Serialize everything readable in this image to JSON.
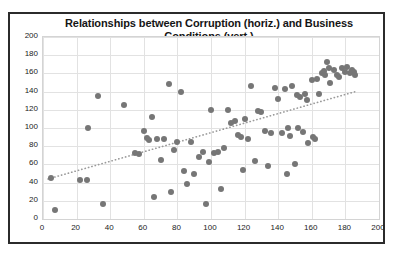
{
  "chart_data": {
    "type": "scatter",
    "title": "Relationships between Corruption (horiz.) and Business Conditions (vert.)",
    "title_line1": "Relationships between Corruption (horiz.) and Business",
    "title_line2": "Conditions (vert.)",
    "xlabel": "Corruption",
    "ylabel": "Business Conditions",
    "xlim": [
      0,
      200
    ],
    "ylim": [
      0,
      200
    ],
    "xticks": [
      0,
      20,
      40,
      60,
      80,
      100,
      120,
      140,
      160,
      180,
      200
    ],
    "yticks": [
      0,
      20,
      40,
      60,
      80,
      100,
      120,
      140,
      160,
      180,
      200
    ],
    "grid": true,
    "legend": "none",
    "marker_color": "#767676",
    "marker_size": 6,
    "trendline": {
      "type": "linear",
      "style": "dotted",
      "color": "#9a9a9a",
      "x_start": 3,
      "y_start": 44,
      "x_end": 186,
      "y_end": 140
    },
    "points": [
      {
        "x": 7,
        "y": 10
      },
      {
        "x": 5,
        "y": 45
      },
      {
        "x": 22,
        "y": 43
      },
      {
        "x": 26,
        "y": 43
      },
      {
        "x": 27,
        "y": 100
      },
      {
        "x": 33,
        "y": 135
      },
      {
        "x": 36,
        "y": 17
      },
      {
        "x": 48,
        "y": 125
      },
      {
        "x": 55,
        "y": 73
      },
      {
        "x": 57,
        "y": 71
      },
      {
        "x": 60,
        "y": 97
      },
      {
        "x": 62,
        "y": 89
      },
      {
        "x": 63,
        "y": 87
      },
      {
        "x": 65,
        "y": 112
      },
      {
        "x": 66,
        "y": 24
      },
      {
        "x": 68,
        "y": 88
      },
      {
        "x": 70,
        "y": 65
      },
      {
        "x": 72,
        "y": 88
      },
      {
        "x": 75,
        "y": 148
      },
      {
        "x": 76,
        "y": 30
      },
      {
        "x": 78,
        "y": 76
      },
      {
        "x": 80,
        "y": 85
      },
      {
        "x": 82,
        "y": 140
      },
      {
        "x": 84,
        "y": 53
      },
      {
        "x": 86,
        "y": 38
      },
      {
        "x": 88,
        "y": 85
      },
      {
        "x": 90,
        "y": 50
      },
      {
        "x": 93,
        "y": 68
      },
      {
        "x": 95,
        "y": 74
      },
      {
        "x": 97,
        "y": 17
      },
      {
        "x": 99,
        "y": 63
      },
      {
        "x": 100,
        "y": 120
      },
      {
        "x": 102,
        "y": 73
      },
      {
        "x": 104,
        "y": 74
      },
      {
        "x": 106,
        "y": 33
      },
      {
        "x": 108,
        "y": 78
      },
      {
        "x": 110,
        "y": 120
      },
      {
        "x": 112,
        "y": 105
      },
      {
        "x": 114,
        "y": 108
      },
      {
        "x": 116,
        "y": 92
      },
      {
        "x": 118,
        "y": 90
      },
      {
        "x": 119,
        "y": 54
      },
      {
        "x": 120,
        "y": 110
      },
      {
        "x": 122,
        "y": 88
      },
      {
        "x": 124,
        "y": 146
      },
      {
        "x": 126,
        "y": 64
      },
      {
        "x": 128,
        "y": 119
      },
      {
        "x": 130,
        "y": 118
      },
      {
        "x": 132,
        "y": 97
      },
      {
        "x": 134,
        "y": 58
      },
      {
        "x": 136,
        "y": 95
      },
      {
        "x": 138,
        "y": 144
      },
      {
        "x": 140,
        "y": 132
      },
      {
        "x": 142,
        "y": 95
      },
      {
        "x": 144,
        "y": 143
      },
      {
        "x": 145,
        "y": 50
      },
      {
        "x": 146,
        "y": 100
      },
      {
        "x": 147,
        "y": 91
      },
      {
        "x": 148,
        "y": 146
      },
      {
        "x": 150,
        "y": 60
      },
      {
        "x": 151,
        "y": 136
      },
      {
        "x": 152,
        "y": 100
      },
      {
        "x": 153,
        "y": 134
      },
      {
        "x": 155,
        "y": 96
      },
      {
        "x": 156,
        "y": 137
      },
      {
        "x": 157,
        "y": 131
      },
      {
        "x": 158,
        "y": 83
      },
      {
        "x": 160,
        "y": 153
      },
      {
        "x": 161,
        "y": 90
      },
      {
        "x": 162,
        "y": 88
      },
      {
        "x": 163,
        "y": 154
      },
      {
        "x": 164,
        "y": 137
      },
      {
        "x": 166,
        "y": 160
      },
      {
        "x": 167,
        "y": 163
      },
      {
        "x": 168,
        "y": 158
      },
      {
        "x": 169,
        "y": 172
      },
      {
        "x": 170,
        "y": 166
      },
      {
        "x": 171,
        "y": 150
      },
      {
        "x": 173,
        "y": 164
      },
      {
        "x": 175,
        "y": 158
      },
      {
        "x": 176,
        "y": 156
      },
      {
        "x": 178,
        "y": 166
      },
      {
        "x": 180,
        "y": 161
      },
      {
        "x": 181,
        "y": 167
      },
      {
        "x": 183,
        "y": 160
      },
      {
        "x": 184,
        "y": 164
      },
      {
        "x": 185,
        "y": 162
      },
      {
        "x": 186,
        "y": 158
      }
    ]
  }
}
